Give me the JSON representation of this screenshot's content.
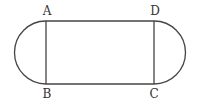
{
  "figure": {
    "type": "stadium-shape",
    "labels": {
      "A": "A",
      "B": "B",
      "C": "C",
      "D": "D"
    },
    "colors": {
      "line": "#444444",
      "text": "#333333",
      "background": "#ffffff"
    }
  }
}
